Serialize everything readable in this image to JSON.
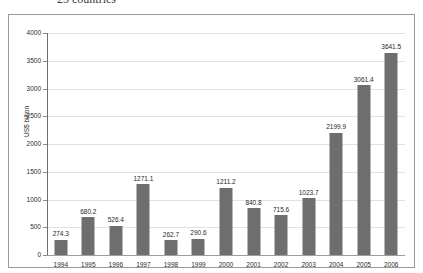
{
  "caption": {
    "text": "25 countries"
  },
  "chart_data": {
    "type": "bar",
    "title": "",
    "subtitle": "",
    "xlabel": "",
    "ylabel": "US$ billion",
    "ylim": [
      0,
      4000
    ],
    "ytick_step": 500,
    "yticks": [
      "4000",
      "3500",
      "3000",
      "2500",
      "2000",
      "1500",
      "1000",
      "500",
      "0"
    ],
    "grid": true,
    "legend": "none",
    "bar_color": "#6e6e6e",
    "gridline_color": "#e2e2e2",
    "axis_color": "#6f6f6f",
    "categories": [
      "1994",
      "1995",
      "1996",
      "1997",
      "1998",
      "1999",
      "2000",
      "2001",
      "2002",
      "2003",
      "2004",
      "2005",
      "2006"
    ],
    "values": [
      274.3,
      680.2,
      526.4,
      1271.1,
      262.7,
      290.6,
      1211.2,
      840.8,
      715.6,
      1023.7,
      2199.9,
      3061.4,
      3641.5
    ],
    "value_labels": [
      "274.3",
      "680.2",
      "526.4",
      "1271.1",
      "262.7",
      "290.6",
      "1211.2",
      "840.8",
      "715.6",
      "1023.7",
      "2199.9",
      "3061.4",
      "3641.5"
    ]
  }
}
